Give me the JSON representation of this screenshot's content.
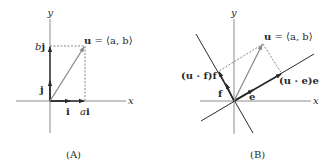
{
  "panels": [
    {
      "id": "A",
      "caption": "(A)",
      "axis_labels": {
        "x": "x",
        "y": "y"
      },
      "vector_label": {
        "bold": "u",
        "rest": " = ⟨a, b⟩"
      },
      "labels": {
        "bj": {
          "ital": "b",
          "bold": "j"
        },
        "j": "j",
        "i": "i",
        "ai": {
          "ital": "a",
          "bold": "i"
        }
      }
    },
    {
      "id": "B",
      "caption": "(B)",
      "axis_labels": {
        "x": "x",
        "y": "y"
      },
      "vector_label": {
        "bold": "u",
        "rest": " = ⟨a, b⟩"
      },
      "labels": {
        "uff": "(u · f)f",
        "uee": "(u · e)e",
        "f": "f",
        "e": "e"
      }
    }
  ],
  "colors": {
    "axis": "#8c8c8c",
    "vector_u": "#8a8a8a",
    "unit_vectors": "#2b2b2b",
    "dashed": "#555555",
    "text": "#2a2a2a"
  }
}
